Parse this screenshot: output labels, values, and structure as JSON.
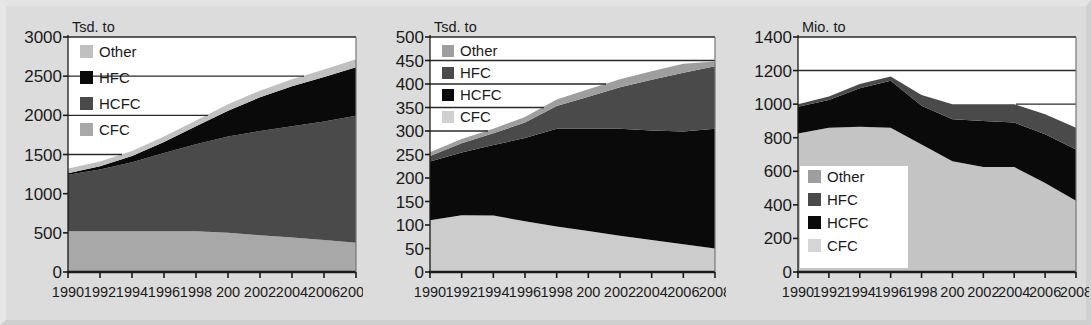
{
  "figure": {
    "background_color": "#dcdcdc",
    "plot_background_color": "#ffffff",
    "axis_color": "#1a1a1a"
  },
  "series_colors": {
    "CFC_light": "#c4c4c4",
    "CFC_lighter": "#d9d9d9",
    "HCFC_dark": "#4a4a4a",
    "HCFC_black": "#0a0a0a",
    "HFC_black": "#0a0a0a",
    "HFC_dark": "#4a4a4a",
    "Other_light": "#c0c0c0",
    "Other_medium": "#9e9e9e"
  },
  "x_tick_labels": [
    "1990",
    "1992",
    "1994",
    "1996",
    "1998",
    "200",
    "2002",
    "2004",
    "2006",
    "2008"
  ],
  "chart_data": [
    {
      "type": "area",
      "stacked": true,
      "panel": "left",
      "title": "",
      "ylabel": "Tsd. to",
      "xlabel": "",
      "ylim": [
        0,
        3000
      ],
      "yticks": [
        0,
        500,
        1000,
        1500,
        2000,
        2500,
        3000
      ],
      "ytick_labels": [
        "0",
        "500",
        "1000",
        "1500",
        "2000",
        "2500",
        "3000"
      ],
      "xlim": [
        1990,
        2008
      ],
      "x": [
        1990,
        1992,
        1994,
        1996,
        1998,
        2000,
        2002,
        2004,
        2006,
        2008
      ],
      "xtick_labels": [
        "1990",
        "1992",
        "1994",
        "1996",
        "1998",
        "200",
        "2002",
        "2004",
        "2006",
        "2008"
      ],
      "grid": true,
      "legend_position": "upper-left",
      "legend_entries": [
        "Other",
        "HFC",
        "HCFC",
        "CFC"
      ],
      "legend_colors": [
        "#c0c0c0",
        "#0a0a0a",
        "#4a4a4a",
        "#a8a8a8"
      ],
      "series": [
        {
          "name": "CFC",
          "color": "#a8a8a8",
          "values": [
            520,
            520,
            520,
            520,
            520,
            500,
            470,
            440,
            410,
            375
          ]
        },
        {
          "name": "HCFC",
          "color": "#4a4a4a",
          "values": [
            720,
            790,
            880,
            1000,
            1110,
            1230,
            1330,
            1420,
            1510,
            1620
          ]
        },
        {
          "name": "HFC",
          "color": "#0a0a0a",
          "values": [
            20,
            40,
            80,
            140,
            230,
            330,
            430,
            510,
            570,
            620
          ]
        },
        {
          "name": "Other",
          "color": "#c0c0c0",
          "values": [
            60,
            60,
            65,
            70,
            75,
            80,
            85,
            90,
            95,
            100
          ]
        }
      ]
    },
    {
      "type": "area",
      "stacked": true,
      "panel": "center",
      "title": "",
      "ylabel": "Tsd. to",
      "xlabel": "",
      "ylim": [
        0,
        500
      ],
      "yticks": [
        0,
        50,
        100,
        150,
        200,
        250,
        300,
        350,
        400,
        450,
        500
      ],
      "ytick_labels": [
        "0",
        "50",
        "100",
        "150",
        "200",
        "250",
        "300",
        "350",
        "400",
        "450",
        "500"
      ],
      "xlim": [
        1990,
        2008
      ],
      "x": [
        1990,
        1992,
        1994,
        1996,
        1998,
        2000,
        2002,
        2004,
        2006,
        2008
      ],
      "xtick_labels": [
        "1990",
        "1992",
        "1994",
        "1996",
        "1998",
        "200",
        "2002",
        "2004",
        "2006",
        "2008"
      ],
      "grid": true,
      "legend_position": "upper-left",
      "legend_entries": [
        "Other",
        "HFC",
        "HCFC",
        "CFC"
      ],
      "legend_colors": [
        "#9e9e9e",
        "#4a4a4a",
        "#0a0a0a",
        "#d0d0d0"
      ],
      "series": [
        {
          "name": "CFC",
          "color": "#cccccc",
          "values": [
            110,
            121,
            120,
            108,
            97,
            87,
            77,
            68,
            59,
            50
          ]
        },
        {
          "name": "HCFC",
          "color": "#0a0a0a",
          "values": [
            125,
            133,
            150,
            177,
            208,
            218,
            228,
            233,
            240,
            255
          ]
        },
        {
          "name": "HFC",
          "color": "#4a4a4a",
          "values": [
            12,
            20,
            25,
            33,
            48,
            68,
            88,
            108,
            125,
            133
          ]
        },
        {
          "name": "Other",
          "color": "#9e9e9e",
          "values": [
            8,
            9,
            10,
            12,
            14,
            16,
            17,
            18,
            19,
            10
          ]
        }
      ]
    },
    {
      "type": "area",
      "stacked": true,
      "panel": "right",
      "title": "",
      "ylabel": "Mio. to",
      "xlabel": "",
      "ylim": [
        0,
        1400
      ],
      "yticks": [
        0,
        200,
        400,
        600,
        800,
        1000,
        1200,
        1400
      ],
      "ytick_labels": [
        "0",
        "200",
        "400",
        "600",
        "800",
        "1000",
        "1200",
        "1400"
      ],
      "xlim": [
        1990,
        2008
      ],
      "x": [
        1990,
        1992,
        1994,
        1996,
        1998,
        2000,
        2002,
        2004,
        2006,
        2008
      ],
      "xtick_labels": [
        "1990",
        "1992",
        "1994",
        "1996",
        "1998",
        "200",
        "2002",
        "2004",
        "2006",
        "2008"
      ],
      "grid": true,
      "legend_position": "lower-left",
      "legend_entries": [
        "Other",
        "HFC",
        "HCFC",
        "CFC"
      ],
      "legend_colors": [
        "#9e9e9e",
        "#4a4a4a",
        "#0a0a0a",
        "#d5d5d5"
      ],
      "series": [
        {
          "name": "CFC",
          "color": "#c4c4c4",
          "values": [
            825,
            860,
            865,
            860,
            760,
            660,
            625,
            625,
            530,
            425
          ]
        },
        {
          "name": "HCFC",
          "color": "#0a0a0a",
          "values": [
            160,
            165,
            230,
            280,
            230,
            250,
            275,
            265,
            290,
            305
          ]
        },
        {
          "name": "HFC",
          "color": "#4a4a4a",
          "values": [
            15,
            20,
            25,
            25,
            65,
            90,
            100,
            110,
            120,
            130
          ]
        },
        {
          "name": "Other",
          "color": "#9e9e9e",
          "values": [
            0,
            0,
            0,
            0,
            0,
            0,
            0,
            0,
            0,
            0
          ]
        }
      ]
    }
  ]
}
